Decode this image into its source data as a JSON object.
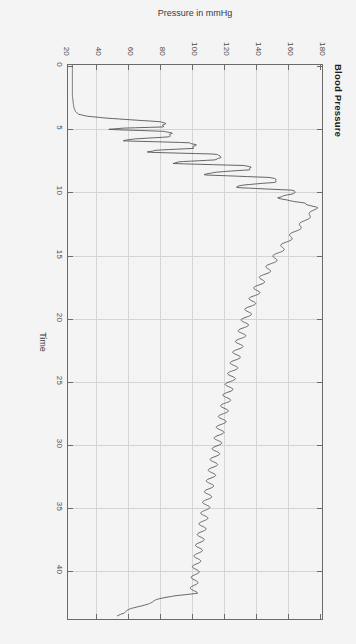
{
  "figure": {
    "title": "Blood Pressure",
    "rotation_deg": 90,
    "background": "#f4f4f4",
    "frame_color": "#6b6b6b",
    "grid_color": "#d4d4d4",
    "line_color": "#555555"
  },
  "chart_data": {
    "type": "line",
    "title": "Blood Pressure",
    "xlabel": "Time",
    "ylabel": "Pressure in mmHg",
    "xlim": [
      0,
      44
    ],
    "ylim": [
      20,
      180
    ],
    "xticks": [
      0,
      5,
      10,
      15,
      20,
      25,
      30,
      35,
      40
    ],
    "xticklabels": [
      "0",
      "5",
      "10",
      "15",
      "20",
      "25",
      "30",
      "35",
      "40"
    ],
    "yticks": [
      20,
      40,
      60,
      80,
      100,
      120,
      140,
      160,
      180
    ],
    "yticklabels": [
      "20",
      "40",
      "60",
      "80",
      "100",
      "120",
      "140",
      "160",
      "180"
    ],
    "grid": true,
    "legend": null,
    "series": [
      {
        "name": "Cuff pressure",
        "description": "Oscillometric cuff trace: low baseline near 24 mmHg, rapid inflation to ~180 mmHg with superimposed oscillations, stepwise deflation with large oscillation spikes between t=4.5 and t=11, smooth decaying ramp from ~175 to ~100 mmHg through t=42, then rapid release below 60 mmHg.",
        "x": [
          0,
          0.6,
          1.2,
          1.8,
          2.4,
          3.0,
          3.4,
          3.7,
          3.9,
          4.05,
          4.2,
          4.35,
          4.5,
          4.6,
          4.75,
          4.9,
          5.0,
          5.1,
          5.25,
          5.4,
          5.55,
          5.7,
          5.85,
          6.0,
          6.15,
          6.3,
          6.45,
          6.6,
          6.75,
          6.9,
          7.05,
          7.2,
          7.35,
          7.5,
          7.65,
          7.8,
          7.95,
          8.1,
          8.3,
          8.5,
          8.7,
          8.9,
          9.1,
          9.3,
          9.5,
          9.7,
          9.9,
          10.1,
          10.3,
          10.5,
          10.7,
          10.9,
          11.1,
          11.3,
          11.5,
          11.8,
          12.2,
          12.8,
          13.5,
          14.3,
          15.2,
          16.2,
          17.3,
          18.5,
          19.8,
          21.2,
          22.7,
          24.3,
          26.0,
          27.8,
          29.7,
          31.7,
          33.8,
          36.0,
          38.3,
          40.0,
          41.2,
          41.8,
          42.0,
          42.3,
          43.0,
          43.6
        ],
        "y": [
          24,
          24,
          24,
          24,
          24,
          24.5,
          25,
          26,
          28,
          33,
          45,
          62,
          80,
          82,
          81,
          80.5,
          55,
          46,
          82,
          86,
          85,
          84,
          62,
          55,
          97,
          101,
          100,
          99,
          76,
          70,
          113,
          117,
          116,
          114,
          92,
          86,
          131,
          136,
          134,
          112,
          106,
          148,
          152,
          150,
          130,
          126,
          161,
          164,
          158,
          152,
          158,
          168,
          172,
          176,
          175,
          173,
          170,
          166,
          161,
          156,
          151,
          146,
          141,
          137,
          133,
          130,
          127,
          124,
          121,
          118,
          115,
          112,
          109,
          106,
          103,
          101,
          100,
          100,
          88,
          78,
          62,
          52
        ],
        "yunit": "mmHg"
      }
    ]
  },
  "axes": {
    "x": {
      "label": "Time",
      "ticks": [
        "0",
        "5",
        "10",
        "15",
        "20",
        "25",
        "30",
        "35",
        "40"
      ]
    },
    "y": {
      "label": "Pressure in mmHg",
      "ticks": [
        "20",
        "40",
        "60",
        "80",
        "100",
        "120",
        "140",
        "160",
        "180"
      ]
    }
  }
}
